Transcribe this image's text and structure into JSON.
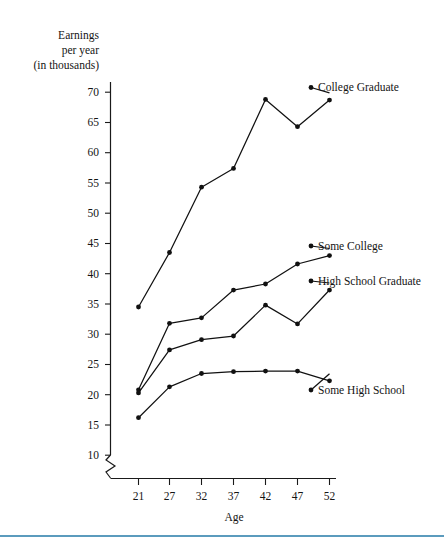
{
  "figure": {
    "background_color": "#ffffff",
    "ink_color": "#111111",
    "rule_color": "#5b9bbd"
  },
  "axis_titles": {
    "y_line1": "Earnings",
    "y_line2": "per year",
    "y_line3": "(in thousands)",
    "x": "Age"
  },
  "chart_data": {
    "type": "line",
    "title": "",
    "subtitle": "",
    "xlabel": "Age",
    "ylabel": "Earnings per year (in thousands)",
    "x": [
      21,
      27,
      32,
      37,
      42,
      47,
      52
    ],
    "x_tick_labels": [
      "21",
      "27",
      "32",
      "37",
      "42",
      "47",
      "52"
    ],
    "y_tick_labels": [
      "10",
      "15",
      "20",
      "25",
      "30",
      "35",
      "40",
      "45",
      "50",
      "55",
      "60",
      "65",
      "70"
    ],
    "y_ticks": [
      10,
      15,
      20,
      25,
      30,
      35,
      40,
      45,
      50,
      55,
      60,
      65,
      70
    ],
    "xlim": [
      18,
      55
    ],
    "ylim": [
      8,
      72
    ],
    "grid": false,
    "legend_position": "right-inline-labels",
    "axis_break": true,
    "series": [
      {
        "name": "College Graduate",
        "label": "College Graduate",
        "values": [
          34.5,
          43.5,
          54.3,
          57.4,
          68.8,
          64.3,
          68.7
        ]
      },
      {
        "name": "Some College",
        "label": "Some College",
        "values": [
          20.8,
          31.8,
          32.7,
          37.3,
          38.3,
          41.6,
          43.0
        ]
      },
      {
        "name": "High School Graduate",
        "label": "High School Graduate",
        "values": [
          20.3,
          27.4,
          29.1,
          29.7,
          34.8,
          31.7,
          37.3
        ]
      },
      {
        "name": "Some High School",
        "label": "Some High School",
        "values": [
          16.2,
          21.3,
          23.5,
          23.8,
          23.9,
          23.9,
          22.3
        ]
      }
    ]
  }
}
